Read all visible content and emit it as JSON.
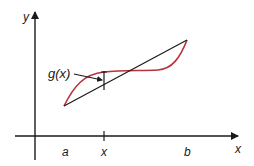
{
  "diagram": {
    "axes": {
      "x_label": "x",
      "y_label": "y"
    },
    "tick_labels": {
      "a": "a",
      "x": "x",
      "b": "b"
    },
    "function_label": "g(x)",
    "colors": {
      "curve": "#b8323c",
      "chord": "#1a1a1a",
      "axes": "#1a1a1a",
      "background": "#ffffff"
    }
  }
}
